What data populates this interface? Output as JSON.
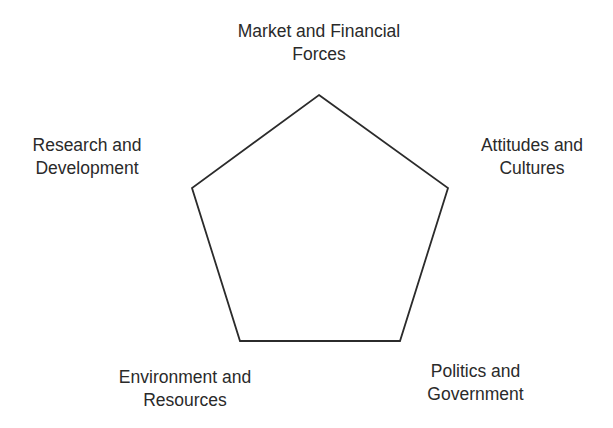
{
  "diagram": {
    "shape": "pentagon",
    "stroke_color": "#2b2b2b",
    "vertices": [
      [
        319,
        95
      ],
      [
        448,
        188
      ],
      [
        400,
        341
      ],
      [
        240,
        341
      ],
      [
        192,
        188
      ]
    ],
    "labels": [
      {
        "id": "top",
        "lines": [
          "Market and Financial",
          "Forces"
        ]
      },
      {
        "id": "upper-right",
        "lines": [
          "Attitudes and",
          "Cultures"
        ]
      },
      {
        "id": "lower-right",
        "lines": [
          "Politics and",
          "Government"
        ]
      },
      {
        "id": "lower-left",
        "lines": [
          "Environment and",
          "Resources"
        ]
      },
      {
        "id": "upper-left",
        "lines": [
          "Research and",
          "Development"
        ]
      }
    ]
  }
}
